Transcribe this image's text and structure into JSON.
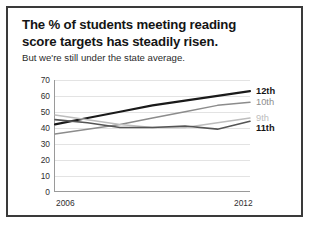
{
  "title": {
    "line1": "The % of students meeting reading",
    "line2": "score targets has steadily risen.",
    "subtitle": "But we're still under the state average."
  },
  "chart_data": {
    "type": "line",
    "title": "The % of students meeting reading score targets has steadily risen.",
    "subtitle": "But we're still under the state average.",
    "xlabel": "",
    "ylabel": "",
    "x": [
      2006,
      2007,
      2008,
      2009,
      2010,
      2011,
      2012
    ],
    "xtick_labels": [
      "2006",
      "2012"
    ],
    "xlim": [
      2006,
      2012
    ],
    "ylim": [
      0,
      70
    ],
    "yticks": [
      0,
      10,
      20,
      30,
      40,
      50,
      60,
      70
    ],
    "ytick_labels": [
      "0",
      "10",
      "20",
      "30",
      "40",
      "50",
      "60",
      "70"
    ],
    "grid": true,
    "legend_position": "right-end-labels",
    "series": [
      {
        "name": "12th",
        "label": "12th",
        "color": "#1a1a1a",
        "width": 2.1,
        "bold_label": true,
        "values": [
          42,
          46,
          50,
          54,
          57,
          60,
          63
        ]
      },
      {
        "name": "10th",
        "label": "10th",
        "color": "#8c8c8c",
        "width": 1.5,
        "bold_label": false,
        "values": [
          36,
          39,
          42,
          46,
          50,
          54,
          56
        ]
      },
      {
        "name": "9th",
        "label": "9th",
        "color": "#bdbdbd",
        "width": 1.5,
        "bold_label": false,
        "values": [
          48,
          45,
          42,
          40,
          40,
          43,
          46
        ]
      },
      {
        "name": "11th",
        "label": "11th",
        "color": "#555555",
        "width": 1.6,
        "bold_label": true,
        "values": [
          45,
          43,
          40,
          40,
          41,
          39,
          44
        ]
      }
    ]
  }
}
